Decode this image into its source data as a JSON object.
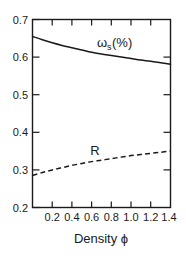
{
  "chart_data": {
    "type": "line",
    "title": "",
    "subtitle": "",
    "xlabel": "Density ϕ",
    "ylabel": "",
    "xlim": [
      0.0,
      1.4
    ],
    "ylim": [
      0.2,
      0.7
    ],
    "grid": false,
    "legend_position": "inline-annotation",
    "x_ticks": [
      0.0,
      0.2,
      0.4,
      0.6,
      0.8,
      1.0,
      1.2,
      1.4
    ],
    "x_tick_labels": [
      "",
      "0.2",
      "0.4",
      "0.6",
      "0.8",
      "1.0",
      "1.2",
      "1.4"
    ],
    "y_ticks": [
      0.2,
      0.3,
      0.4,
      0.5,
      0.6,
      0.7
    ],
    "y_tick_labels": [
      "0.2",
      "0.3",
      "0.4",
      "0.5",
      "0.6",
      "0.7"
    ],
    "x": [
      0.0,
      0.1,
      0.2,
      0.3,
      0.4,
      0.5,
      0.6,
      0.7,
      0.8,
      0.9,
      1.0,
      1.1,
      1.2,
      1.3,
      1.4
    ],
    "series": [
      {
        "name": "ωs(%)",
        "style": "solid",
        "color": "#1a1a1a",
        "values": [
          0.655,
          0.646,
          0.638,
          0.631,
          0.625,
          0.619,
          0.613,
          0.608,
          0.604,
          0.6,
          0.596,
          0.592,
          0.589,
          0.585,
          0.581
        ]
      },
      {
        "name": "R",
        "style": "dashed",
        "color": "#1a1a1a",
        "values": [
          0.285,
          0.293,
          0.3,
          0.306,
          0.312,
          0.317,
          0.322,
          0.326,
          0.33,
          0.334,
          0.338,
          0.341,
          0.344,
          0.347,
          0.35
        ]
      }
    ],
    "annotations": [
      {
        "id": "omega-s-label",
        "text_base": "ω",
        "text_sub": "s",
        "text_tail": "(%)",
        "full_text": "ωs(%)",
        "x": 0.66,
        "y": 0.645
      },
      {
        "id": "r-label",
        "text_base": "R",
        "text_sub": "",
        "text_tail": "",
        "full_text": "R",
        "x": 0.61,
        "y": 0.378
      }
    ]
  },
  "figure": {
    "background_color": "#ffffff",
    "line_color": "#1a1a1a"
  }
}
